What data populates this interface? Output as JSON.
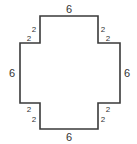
{
  "diagram": {
    "type": "cross-shaped polygon with side lengths",
    "stroke_color": "#3a3a3a",
    "background": "#ffffff",
    "vertices": [
      [
        40,
        16
      ],
      [
        98,
        16
      ],
      [
        98,
        43
      ],
      [
        120,
        43
      ],
      [
        120,
        103
      ],
      [
        98,
        103
      ],
      [
        98,
        129
      ],
      [
        40,
        129
      ],
      [
        40,
        103
      ],
      [
        20,
        103
      ],
      [
        20,
        43
      ],
      [
        40,
        43
      ]
    ],
    "labels": {
      "top": "6",
      "bottom": "6",
      "left": "6",
      "right": "6",
      "top_left_vertical": "2",
      "top_left_horizontal": "2",
      "top_right_vertical": "2",
      "top_right_horizontal": "2",
      "bottom_left_horizontal": "2",
      "bottom_left_vertical": "2",
      "bottom_right_horizontal": "2",
      "bottom_right_vertical": "2"
    }
  }
}
